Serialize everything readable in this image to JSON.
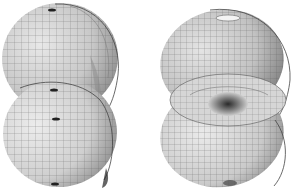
{
  "figures": [
    {
      "id": "left",
      "description": "Two stacked shell-like ellipsoidal surfaces rendered as a gray wireframe mesh, small dark pole markings",
      "lobes": 2
    },
    {
      "id": "right",
      "description": "Two stacked shell-like surfaces rendered as a gray wireframe mesh with a toroidal, funnel-shaped center",
      "lobes": 2
    }
  ],
  "colors": {
    "background": "#ffffff",
    "surface_light": "#e6e6e6",
    "surface_mid": "#bdbdbd",
    "surface_dark": "#6e6e6e",
    "mesh": "#555555"
  }
}
